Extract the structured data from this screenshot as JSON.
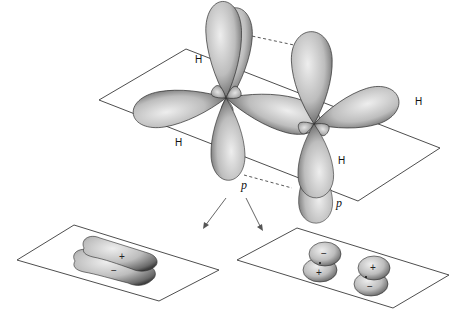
{
  "figure": {
    "labels": {
      "h_top_left": "H",
      "h_bottom_left": "H",
      "h_right": "H",
      "h_bottom_right": "H",
      "p_left": "p",
      "p_right": "p"
    },
    "bonding_orbital": {
      "sign_top": "+",
      "sign_bottom": "−"
    },
    "antibonding_orbital": {
      "left_top": "−",
      "left_bottom": "+",
      "right_top": "+",
      "right_bottom": "−"
    },
    "colors": {
      "lobe_light": "#e8e8e8",
      "lobe_mid": "#b4b4b4",
      "lobe_dark": "#555555",
      "line": "#3a3a3a"
    }
  }
}
